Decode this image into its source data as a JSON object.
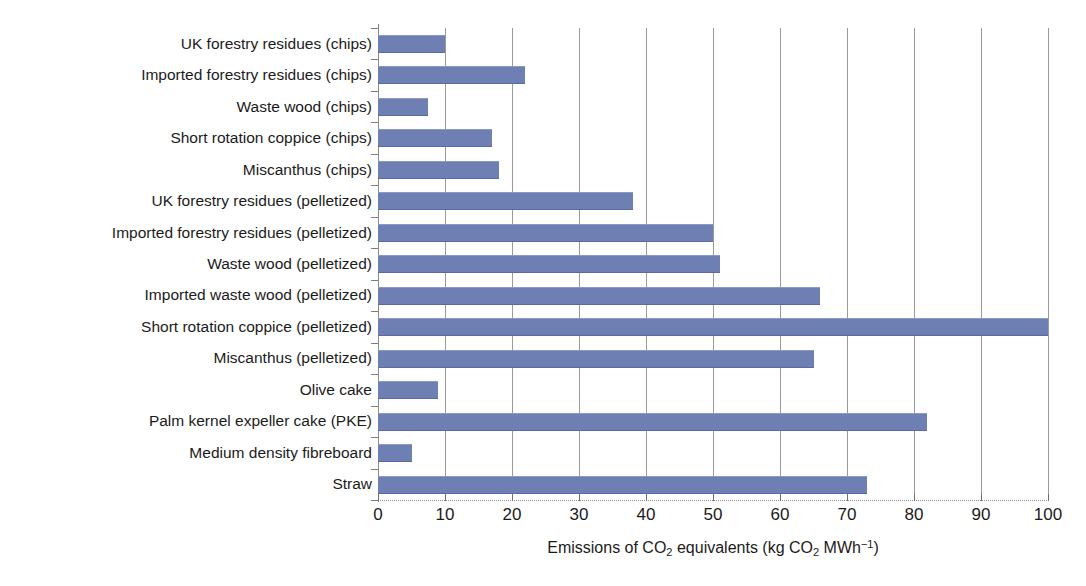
{
  "chart_data": {
    "type": "bar",
    "orientation": "horizontal",
    "title": "",
    "xlabel": "Emissions of CO2 equivalents (kg CO2 MWh-1)",
    "xlabel_parts": {
      "prefix": "Emissions of CO",
      "sub1": "2",
      "middle": " equivalents (kg CO",
      "sub2": "2",
      "unit": " MWh",
      "sup": "−1",
      "suffix": ")"
    },
    "ylabel": "",
    "xlim": [
      0,
      100
    ],
    "xticks": [
      0,
      10,
      20,
      30,
      40,
      50,
      60,
      70,
      80,
      90,
      100
    ],
    "xtick_labels": [
      "0",
      "10",
      "20",
      "30",
      "40",
      "50",
      "60",
      "70",
      "80",
      "90",
      "100"
    ],
    "grid": "vertical",
    "legend": "none",
    "bar_color": "#6e7fb4",
    "categories": [
      "UK forestry residues (chips)",
      "Imported forestry residues (chips)",
      "Waste wood (chips)",
      "Short rotation coppice (chips)",
      "Miscanthus (chips)",
      "UK forestry residues (pelletized)",
      "Imported forestry residues (pelletized)",
      "Waste wood (pelletized)",
      "Imported waste wood (pelletized)",
      "Short rotation coppice (pelletized)",
      "Miscanthus (pelletized)",
      "Olive cake",
      "Palm kernel expeller cake (PKE)",
      "Medium density fibreboard",
      "Straw"
    ],
    "values": [
      10,
      22,
      7.5,
      17,
      18,
      38,
      50,
      51,
      66,
      100,
      65,
      9,
      82,
      5,
      73
    ]
  }
}
